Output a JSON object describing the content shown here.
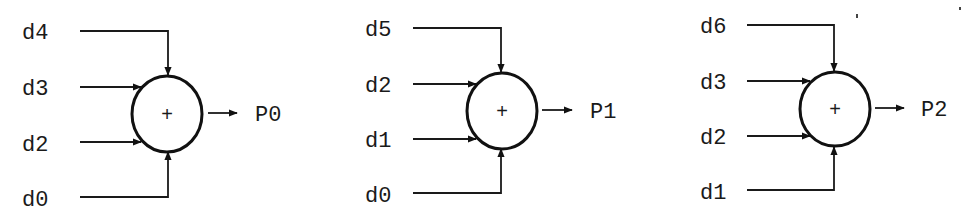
{
  "diagram": {
    "type": "parity-adder-network",
    "operator_symbol": "+",
    "colors": {
      "ink": "#1a1a1a",
      "background": "#ffffff"
    },
    "blocks": [
      {
        "id": "block-0",
        "output": "P0",
        "operator": "+",
        "inputs": [
          {
            "label": "d4",
            "side": "top"
          },
          {
            "label": "d3",
            "side": "left-upper"
          },
          {
            "label": "d2",
            "side": "left-lower"
          },
          {
            "label": "d0",
            "side": "bottom"
          }
        ]
      },
      {
        "id": "block-1",
        "output": "P1",
        "operator": "+",
        "inputs": [
          {
            "label": "d5",
            "side": "top"
          },
          {
            "label": "d2",
            "side": "left-upper"
          },
          {
            "label": "d1",
            "side": "left-lower"
          },
          {
            "label": "d0",
            "side": "bottom"
          }
        ]
      },
      {
        "id": "block-2",
        "output": "P2",
        "operator": "+",
        "inputs": [
          {
            "label": "d6",
            "side": "top"
          },
          {
            "label": "d3",
            "side": "left-upper"
          },
          {
            "label": "d2",
            "side": "left-lower"
          },
          {
            "label": "d1",
            "side": "bottom"
          }
        ]
      }
    ]
  }
}
